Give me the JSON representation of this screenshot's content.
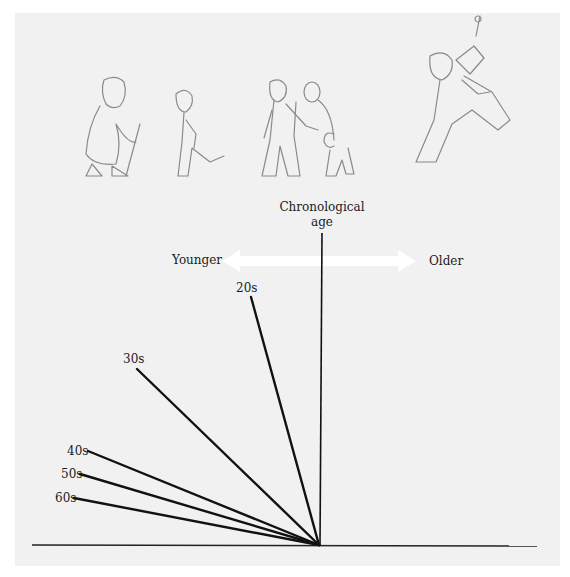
{
  "diagram": {
    "axis_label": {
      "line1": "Chronological",
      "line2": "age"
    },
    "direction": {
      "left": "Younger",
      "right": "Older"
    },
    "age_lines": [
      {
        "label": "20s",
        "x1": 251,
        "y1": 297
      },
      {
        "label": "30s",
        "x1": 137,
        "y1": 369
      },
      {
        "label": "40s",
        "x1": 88,
        "y1": 451
      },
      {
        "label": "50s",
        "x1": 80,
        "y1": 474
      },
      {
        "label": "60s",
        "x1": 74,
        "y1": 498
      }
    ],
    "origin": {
      "x": 319,
      "y": 545
    },
    "figures": [
      "elderly-woman-with-cane",
      "young-person-kicking",
      "tall-man-walking",
      "child-with-balloon",
      "dancing-clown"
    ],
    "colors": {
      "panel": "#f1f1f1",
      "lines": "#111111",
      "sketch": "#8a8a8a",
      "arrow": "#ffffff"
    }
  }
}
